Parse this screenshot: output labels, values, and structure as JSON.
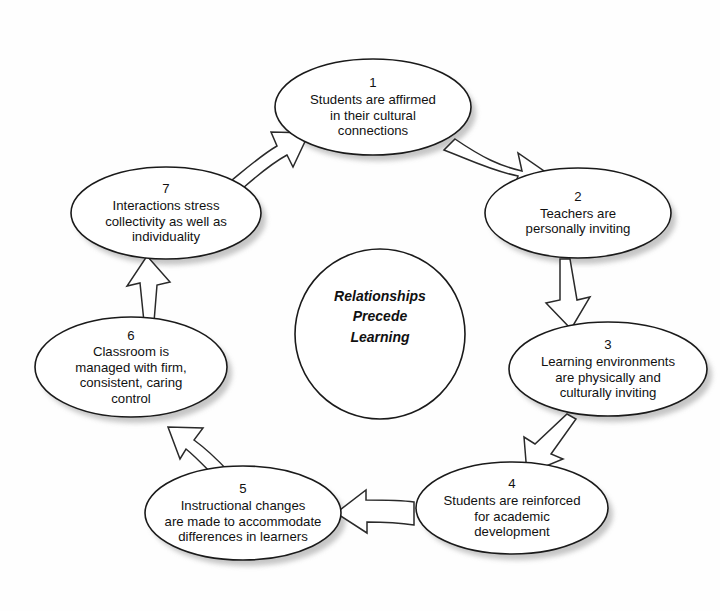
{
  "diagram": {
    "type": "cycle-diagram",
    "background_color": "#fefefe",
    "outline_color": "#1a1a1a",
    "shadow_color": "#b8b8b8",
    "center": {
      "label": "Relationships\nPrecede\nLearning",
      "shape": "circle",
      "cx": 380,
      "cy": 334,
      "r": 85
    },
    "nodes": [
      {
        "number": "1",
        "text": "Students are affirmed\nin their cultural\nconnections",
        "cx": 373,
        "cy": 107,
        "rx": 98,
        "ry": 48
      },
      {
        "number": "2",
        "text": "Teachers are\npersonally inviting",
        "cx": 578,
        "cy": 213,
        "rx": 93,
        "ry": 45
      },
      {
        "number": "3",
        "text": "Learning environments\nare physically and\nculturally inviting",
        "cx": 608,
        "cy": 369,
        "rx": 99,
        "ry": 47
      },
      {
        "number": "4",
        "text": "Students are reinforced\nfor academic\ndevelopment",
        "cx": 512,
        "cy": 508,
        "rx": 96,
        "ry": 46
      },
      {
        "number": "5",
        "text": "Instructional changes\nare made to accommodate\ndifferences in learners",
        "cx": 243,
        "cy": 513,
        "rx": 98,
        "ry": 47
      },
      {
        "number": "6",
        "text": "Classroom is\nmanaged with firm,\nconsistent, caring\ncontrol",
        "cx": 131,
        "cy": 367,
        "rx": 96,
        "ry": 50
      },
      {
        "number": "7",
        "text": "Interactions stress\ncollectivity as well as\nindividuality",
        "cx": 166,
        "cy": 213,
        "rx": 95,
        "ry": 46
      }
    ],
    "arrows": [
      {
        "from": "1",
        "to": "2",
        "style": "hollow-block-curved"
      },
      {
        "from": "2",
        "to": "3",
        "style": "hollow-block-straight"
      },
      {
        "from": "3",
        "to": "4",
        "style": "hollow-block-straight"
      },
      {
        "from": "4",
        "to": "5",
        "style": "hollow-block-curved"
      },
      {
        "from": "5",
        "to": "6",
        "style": "hollow-block-curved"
      },
      {
        "from": "6",
        "to": "7",
        "style": "hollow-block-straight"
      },
      {
        "from": "7",
        "to": "1",
        "style": "hollow-block-curved"
      }
    ]
  }
}
